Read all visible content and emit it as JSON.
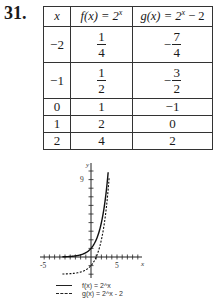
{
  "problem_number": "31.",
  "table": {
    "headers": {
      "x": "x",
      "f": "f(x) = 2",
      "f_exp": "x",
      "g": "g(x) = 2",
      "g_exp": "x",
      "g_tail": " − 2"
    },
    "rows": [
      {
        "x": "−2",
        "f_num": "1",
        "f_den": "4",
        "g_sign": "−",
        "g_num": "7",
        "g_den": "4"
      },
      {
        "x": "−1",
        "f_num": "1",
        "f_den": "2",
        "g_sign": "−",
        "g_num": "3",
        "g_den": "2"
      },
      {
        "x": "0",
        "f": "1",
        "g": "−1"
      },
      {
        "x": "1",
        "f": "2",
        "g": "0"
      },
      {
        "x": "2",
        "f": "4",
        "g": "2"
      }
    ]
  },
  "chart_data": {
    "type": "line",
    "title": "",
    "xlabel": "x",
    "ylabel": "y",
    "tick_labels": {
      "x": [
        "-5",
        "5"
      ],
      "y": [
        "9"
      ]
    },
    "xlim": [
      -5.5,
      5.5
    ],
    "ylim": [
      -2,
      10
    ],
    "grid": false,
    "legend_position": "bottom",
    "series": [
      {
        "name": "f(x) = 2^x",
        "style": "solid",
        "x": [
          -5,
          -4,
          -3,
          -2,
          -1,
          0,
          1,
          2,
          3,
          3.3
        ],
        "values": [
          0.03,
          0.06,
          0.125,
          0.25,
          0.5,
          1,
          2,
          4,
          8,
          9.85
        ]
      },
      {
        "name": "g(x) = 2^x - 2",
        "style": "dashed",
        "x": [
          -5,
          -4,
          -3,
          -2,
          -1,
          0,
          1,
          2,
          3,
          3.5
        ],
        "values": [
          -1.97,
          -1.94,
          -1.875,
          -1.75,
          -1.5,
          -1,
          0,
          2,
          6,
          9.3
        ]
      }
    ]
  },
  "legend": [
    {
      "label": "f(x) = 2^x",
      "style": "solid"
    },
    {
      "label": "g(x) = 2^x - 2",
      "style": "dashed"
    }
  ],
  "axis_labels": {
    "x": "x",
    "y": "y",
    "x_neg": "-5",
    "x_pos": "5",
    "y_top": "9"
  }
}
